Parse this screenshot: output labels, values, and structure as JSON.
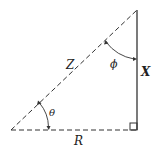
{
  "diagram": {
    "type": "right-triangle",
    "labels": {
      "hypotenuse": "Z",
      "base": "R",
      "vertical": "X",
      "angle_bottom": "θ",
      "angle_top": "ϕ"
    },
    "colors": {
      "stroke": "#333333",
      "background": "#ffffff"
    }
  }
}
